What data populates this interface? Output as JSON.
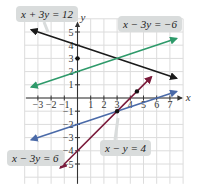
{
  "chart_data": {
    "type": "line",
    "title": "",
    "xlabel": "x",
    "ylabel": "y",
    "xlim": [
      -3.5,
      7.5
    ],
    "ylim": [
      -5.5,
      5.5
    ],
    "grid": true,
    "x_ticks": [
      -3,
      -2,
      -1,
      1,
      2,
      3,
      4,
      5,
      6,
      7
    ],
    "y_ticks": [
      -5,
      -4,
      -3,
      -2,
      -1,
      1,
      2,
      3,
      4,
      5
    ],
    "series": [
      {
        "name": "x + 3y = 12",
        "slope": -0.3333,
        "intercept": 4,
        "color": "#1a1a1a",
        "x_range": [
          -3.5,
          7.5
        ]
      },
      {
        "name": "x - 3y = -6",
        "slope": 0.3333,
        "intercept": 2,
        "color": "#2e9a6a",
        "x_range": [
          -3.5,
          7.5
        ]
      },
      {
        "name": "x - 3y = 6",
        "slope": 0.3333,
        "intercept": -2,
        "color": "#4a6aa8",
        "x_range": [
          -3.5,
          7.5
        ]
      },
      {
        "name": "x - y = 4",
        "slope": 1,
        "intercept": -4,
        "color": "#7a1a3a",
        "x_range": [
          -1.3,
          5.6
        ]
      }
    ],
    "points": [
      {
        "x": 0,
        "y": 3,
        "label": "intersection"
      },
      {
        "x": 3,
        "y": -1,
        "label": "intersection"
      },
      {
        "x": 4.5,
        "y": 0.5,
        "label": "intersection"
      }
    ],
    "annotations": [
      {
        "text": "x + 3y = 12",
        "near": "top-left"
      },
      {
        "text": "x − 3y = −6",
        "near": "top-right"
      },
      {
        "text": "x − 3y = 6",
        "near": "bottom-left"
      },
      {
        "text": "x − y = 4",
        "near": "bottom-right"
      }
    ]
  },
  "labels": {
    "l1": "x + 3y = 12",
    "l2": "x − 3y = −6",
    "l3": "x − 3y = 6",
    "l4": "x − y = 4"
  },
  "axis": {
    "x": "x",
    "y": "y"
  }
}
